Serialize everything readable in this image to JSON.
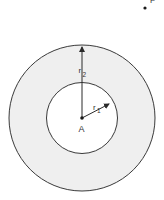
{
  "diagram": {
    "type": "concentric-annulus",
    "center_label": "A",
    "point_label": "P",
    "inner_radius_label": "r",
    "inner_radius_subscript": "1",
    "outer_radius_label": "r",
    "outer_radius_subscript": "2",
    "colors": {
      "stroke": "#3a3a3a",
      "annulus_fill": "#efefef",
      "background": "#ffffff"
    }
  }
}
